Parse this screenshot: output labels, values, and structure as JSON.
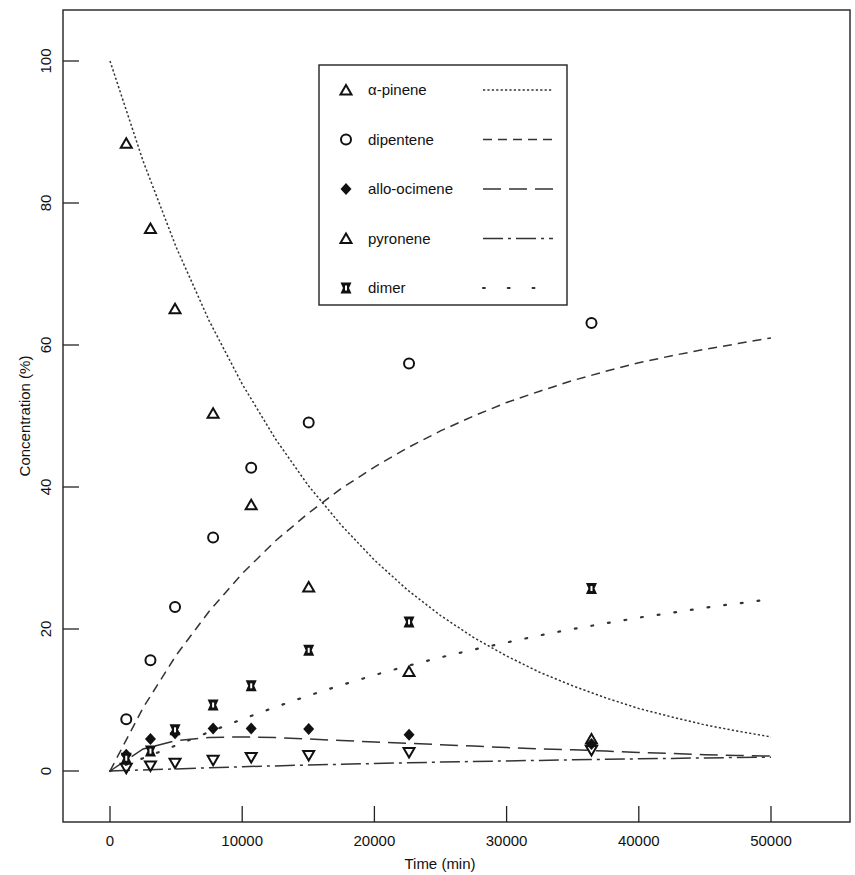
{
  "chart_data": {
    "type": "scatter",
    "title": "",
    "xlabel": "Time (min)",
    "ylabel": "Concentration (%)",
    "xlim": [
      -3500,
      53500
    ],
    "ylim": [
      -7,
      107
    ],
    "x_ticks": [
      0,
      10000,
      20000,
      30000,
      40000,
      50000
    ],
    "y_ticks": [
      0,
      20,
      40,
      60,
      80,
      100
    ],
    "grid": false,
    "legend_position": "upper center (inside plot)",
    "x": [
      1230,
      3060,
      4920,
      7800,
      10680,
      15030,
      22620,
      36420
    ],
    "series": [
      {
        "name": "α-pinene",
        "marker": "triangle-up",
        "line": "dotted",
        "values": [
          88.4,
          76.4,
          65.1,
          50.4,
          37.5,
          25.9,
          14.0,
          4.5
        ]
      },
      {
        "name": "dipentene",
        "marker": "circle-open",
        "line": "short-dash",
        "values": [
          7.3,
          15.6,
          23.1,
          32.9,
          42.7,
          49.1,
          57.4,
          63.1
        ]
      },
      {
        "name": "allo-ocimene",
        "marker": "diamond-filled",
        "line": "long-dash",
        "values": [
          2.3,
          4.5,
          5.3,
          6.0,
          6.0,
          5.9,
          5.1,
          3.8
        ]
      },
      {
        "name": "pyronene",
        "marker": "triangle-down",
        "line": "dash-dot",
        "values": [
          0.4,
          0.7,
          1.1,
          1.5,
          1.9,
          2.2,
          2.6,
          2.9
        ]
      },
      {
        "name": "dimer",
        "marker": "hourglass",
        "line": "sparse-dot",
        "values": [
          1.8,
          2.8,
          5.8,
          9.3,
          12.0,
          17.0,
          21.0,
          25.7
        ]
      }
    ],
    "fitted_curves": {
      "x": [
        0,
        2500,
        5000,
        7500,
        10000,
        12500,
        15000,
        17500,
        20000,
        22500,
        25000,
        27500,
        30000,
        32500,
        35000,
        37500,
        40000,
        42500,
        45000,
        47500,
        50000
      ],
      "α-pinene": [
        100,
        85.9,
        73.8,
        63.4,
        54.5,
        46.8,
        40.2,
        34.6,
        29.7,
        25.5,
        21.9,
        18.8,
        16.2,
        13.9,
        12.0,
        10.3,
        8.8,
        7.6,
        6.5,
        5.6,
        4.8
      ],
      "dipentene": [
        0,
        8.9,
        16.3,
        22.5,
        27.8,
        32.4,
        36.3,
        39.8,
        42.8,
        45.5,
        47.9,
        50.0,
        51.9,
        53.5,
        55.0,
        56.3,
        57.5,
        58.5,
        59.4,
        60.2,
        61.0
      ],
      "allo-ocimene": [
        0,
        3.1,
        4.3,
        4.7,
        4.8,
        4.7,
        4.5,
        4.3,
        4.1,
        3.9,
        3.7,
        3.5,
        3.3,
        3.1,
        3.0,
        2.8,
        2.6,
        2.5,
        2.3,
        2.2,
        2.1
      ],
      "pyronene": [
        0,
        0.15,
        0.3,
        0.45,
        0.6,
        0.72,
        0.84,
        0.95,
        1.05,
        1.15,
        1.25,
        1.34,
        1.42,
        1.5,
        1.58,
        1.65,
        1.72,
        1.78,
        1.84,
        1.9,
        1.95
      ],
      "dimer": [
        0,
        1.8,
        3.6,
        5.5,
        7.3,
        9.0,
        10.6,
        12.1,
        13.5,
        14.8,
        16.0,
        17.1,
        18.1,
        19.1,
        20.0,
        20.8,
        21.6,
        22.3,
        23.0,
        23.6,
        24.2
      ]
    }
  },
  "legend": [
    {
      "label": "α-pinene",
      "marker": "triangle-up-icon"
    },
    {
      "label": "dipentene",
      "marker": "circle-icon"
    },
    {
      "label": "allo-ocimene",
      "marker": "diamond-icon"
    },
    {
      "label": "pyronene",
      "marker": "triangle-up-icon"
    },
    {
      "label": "dimer",
      "marker": "hourglass-icon"
    }
  ],
  "axes": {
    "x_title": "Time (min)",
    "y_title": "Concentration (%)",
    "x_tick_labels": [
      "0",
      "10000",
      "20000",
      "30000",
      "40000",
      "50000"
    ],
    "y_tick_labels": [
      "0",
      "20",
      "40",
      "60",
      "80",
      "100"
    ]
  }
}
